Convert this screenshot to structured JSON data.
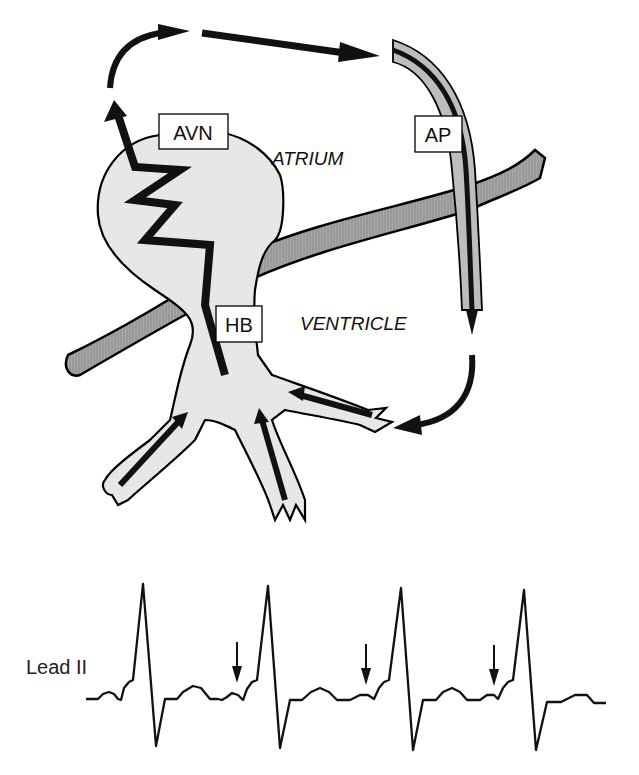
{
  "diagram": {
    "labels": {
      "avn": "AVN",
      "ap": "AP",
      "hb": "HB",
      "atrium": "ATRIUM",
      "ventricle": "VENTRICLE"
    },
    "colors": {
      "tissue_fill": "#e6e6e6",
      "valve_ring_fill": "#9a9a9a",
      "arrow": "#111111",
      "outline": "#000000"
    }
  },
  "ecg": {
    "lead_label": "Lead II",
    "beats": 4,
    "markers": [
      {
        "beat_before": 2,
        "description": "delta-wave arrow"
      },
      {
        "beat_before": 3,
        "description": "delta-wave arrow"
      },
      {
        "beat_before": 4,
        "description": "delta-wave arrow"
      }
    ]
  }
}
